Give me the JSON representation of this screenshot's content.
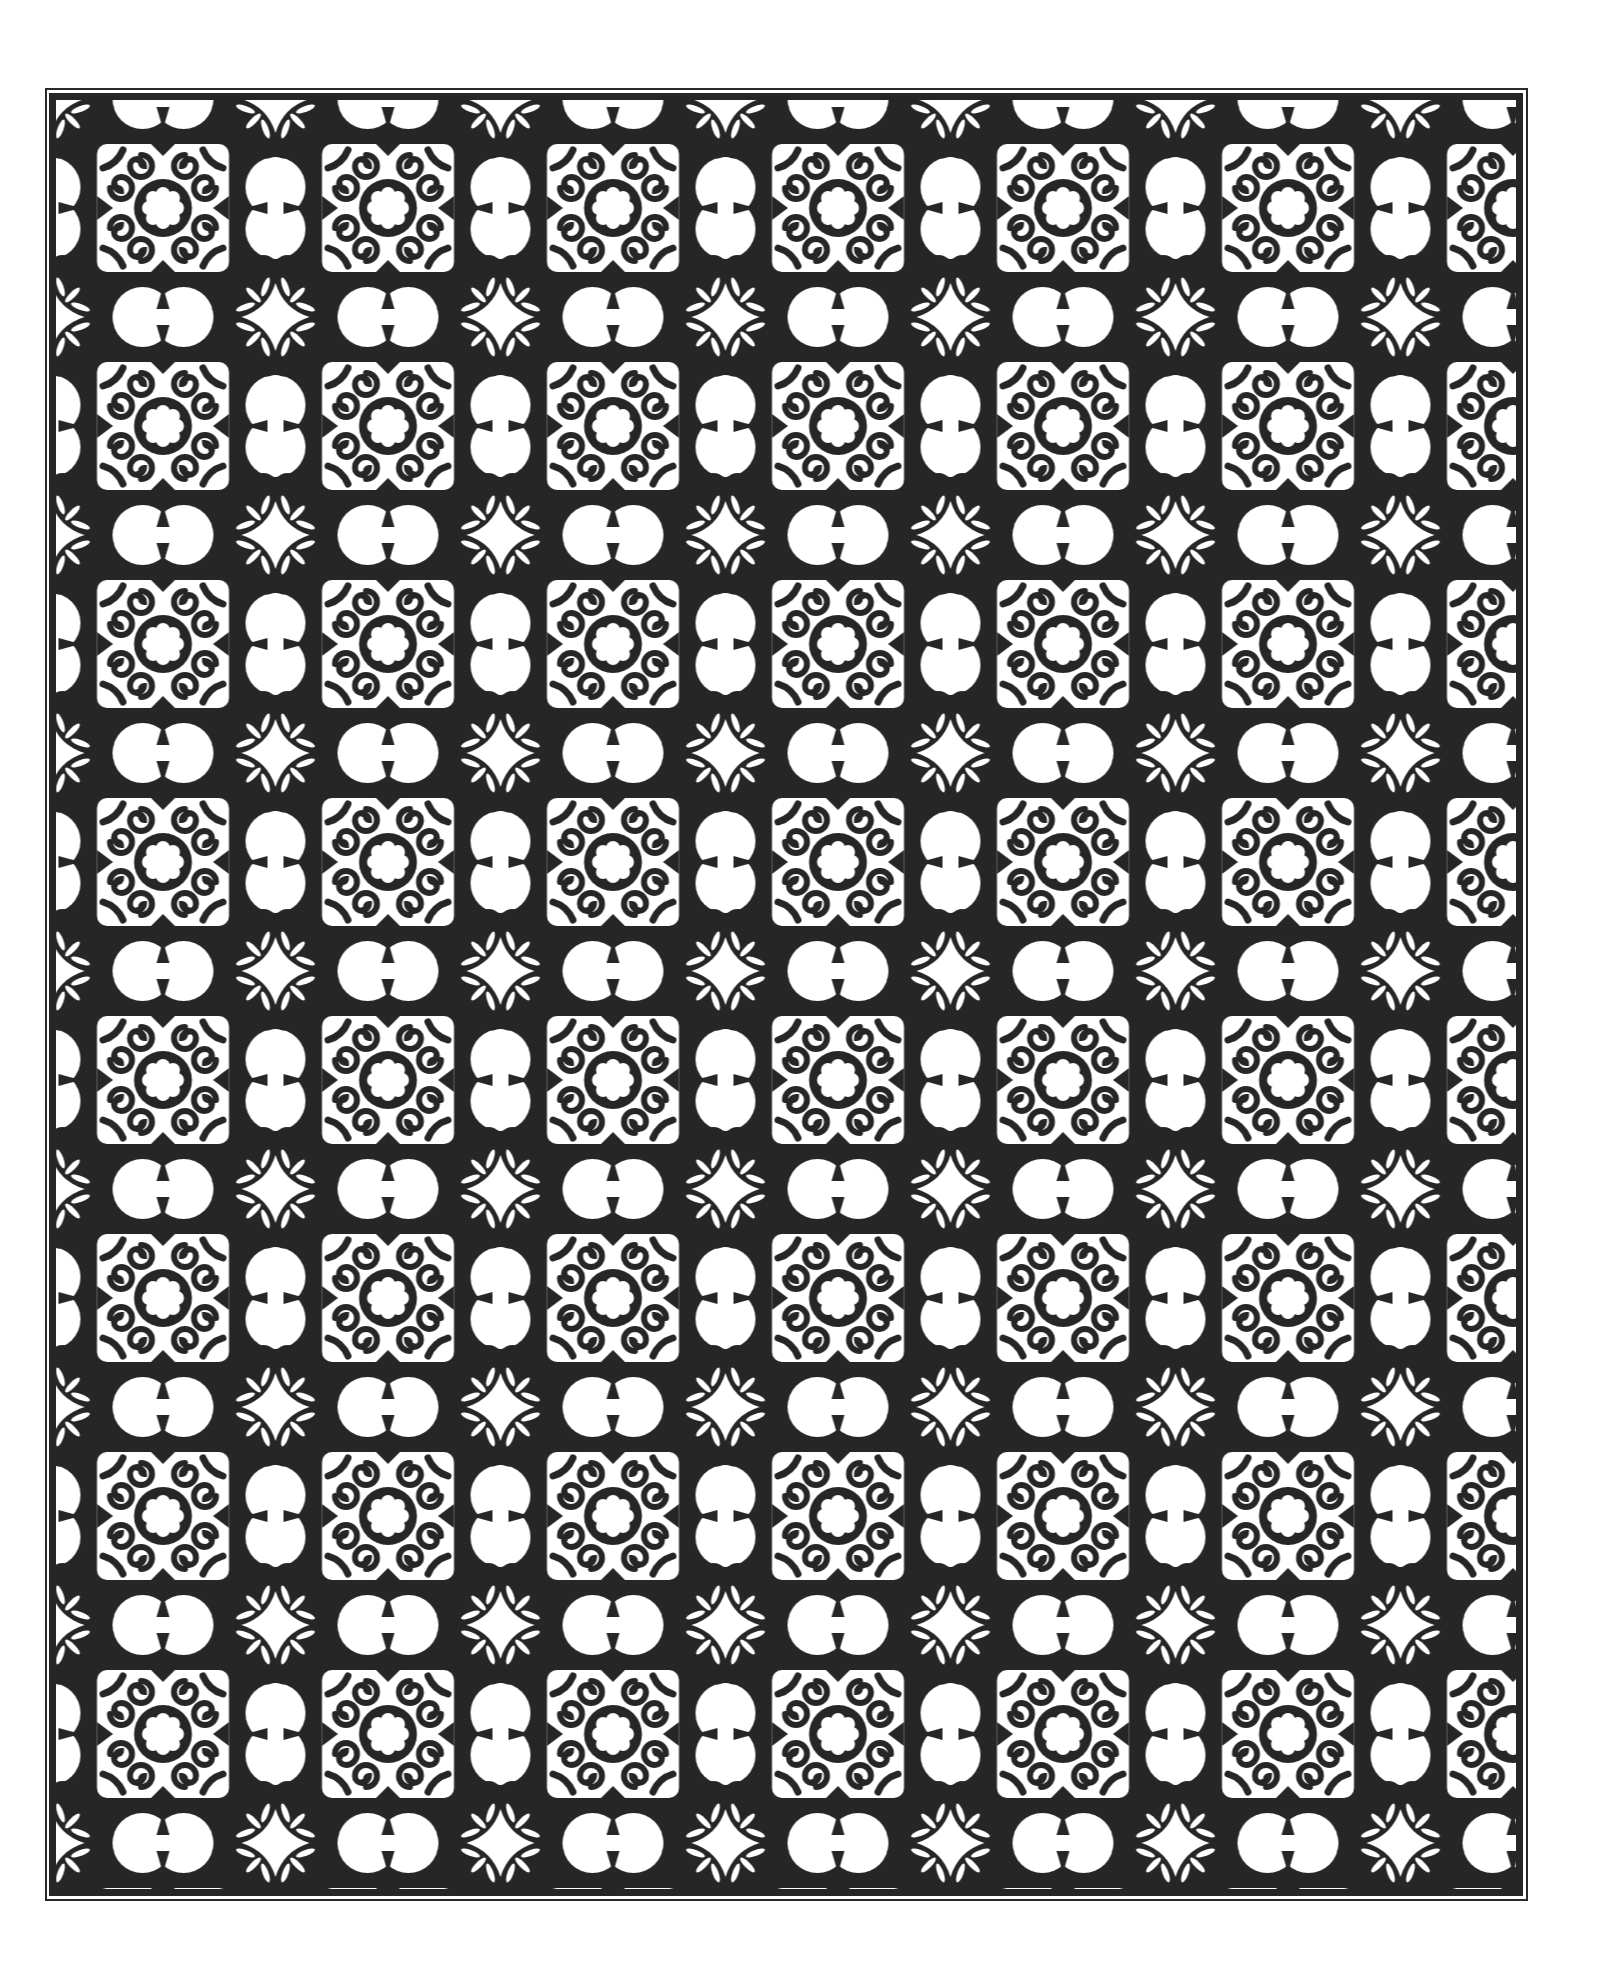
{
  "page": {
    "title": "Ornamental tile pattern coloring page",
    "background": "#ffffff"
  },
  "frame": {
    "outer": {
      "left": 45,
      "top": 88,
      "right": 1528,
      "bottom": 1901,
      "stroke": "#2a2a2a",
      "width": 2
    },
    "inner": {
      "left": 49,
      "top": 93,
      "right": 1523,
      "bottom": 1896,
      "stroke": "#262626",
      "width": 7
    }
  },
  "pattern": {
    "ink_color": "#262626",
    "paper_color": "#ffffff",
    "tile_width": 225,
    "tile_height": 218,
    "origin_x": 50.5,
    "origin_y": 99,
    "columns_of_rosettes": 7,
    "rows_of_rosettes": 8,
    "motifs": [
      "rosette-medallion",
      "vertical-dumbbell",
      "horizontal-dumbbell",
      "four-point-star-junction",
      "scroll-hooks",
      "corner-leaves"
    ]
  }
}
